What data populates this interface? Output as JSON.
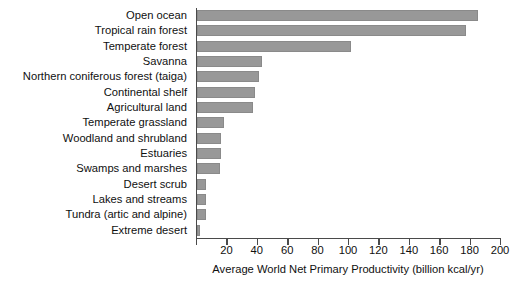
{
  "chart_data": {
    "type": "bar",
    "orientation": "horizontal",
    "title": "",
    "xlabel": "Average World Net Primary Productivity (billion kcal/yr)",
    "ylabel": "",
    "xlim": [
      0,
      200
    ],
    "xticks": [
      0,
      20,
      40,
      60,
      80,
      100,
      120,
      140,
      160,
      180,
      200
    ],
    "xtick_labels": [
      "",
      "20",
      "40",
      "60",
      "80",
      "100",
      "120",
      "140",
      "160",
      "180",
      "200"
    ],
    "grid": false,
    "legend": null,
    "bar_color": "#989898",
    "axis_color": "#4a4a4a",
    "categories": [
      "Open ocean",
      "Tropical rain forest",
      "Temperate forest",
      "Savanna",
      "Northern coniferous forest (taiga)",
      "Continental shelf",
      "Agricultural land",
      "Temperate grassland",
      "Woodland and shrubland",
      "Estuaries",
      "Swamps and marshes",
      "Desert scrub",
      "Lakes and streams",
      "Tundra (artic and alpine)",
      "Extreme desert"
    ],
    "values": [
      185,
      177,
      101,
      43,
      41,
      38,
      37,
      18,
      16,
      16,
      15,
      6,
      6,
      6,
      2
    ]
  }
}
